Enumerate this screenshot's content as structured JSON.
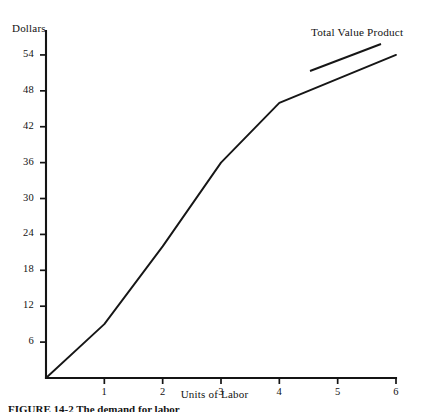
{
  "figure": {
    "caption": "FIGURE 14-2  The demand for labor"
  },
  "chart_data": {
    "type": "line",
    "title": "",
    "xlabel": "Units of Labor",
    "ylabel": "Dollars",
    "series": [
      {
        "name": "Total Value Product",
        "x": [
          0,
          1,
          2,
          3,
          4,
          6
        ],
        "values": [
          0,
          9,
          22,
          36,
          46,
          54
        ]
      }
    ],
    "annotations": [
      {
        "text": "Total Value Product",
        "x": 4.6,
        "y": 56
      }
    ],
    "xlim": [
      0,
      6
    ],
    "ylim": [
      0,
      58
    ],
    "xticks": [
      1,
      2,
      3,
      4,
      5,
      6
    ],
    "xtick_labels": [
      "1",
      "2",
      "3",
      "4",
      "5",
      "6"
    ],
    "yticks": [
      6,
      12,
      18,
      24,
      30,
      36,
      42,
      48,
      54
    ],
    "ytick_labels": [
      "6",
      "12",
      "18",
      "24",
      "30",
      "36",
      "42",
      "48",
      "54"
    ],
    "grid": false,
    "legend_position": "none",
    "line_color": "#161616",
    "axis_color": "#141414",
    "background_color": "#ffffff"
  }
}
